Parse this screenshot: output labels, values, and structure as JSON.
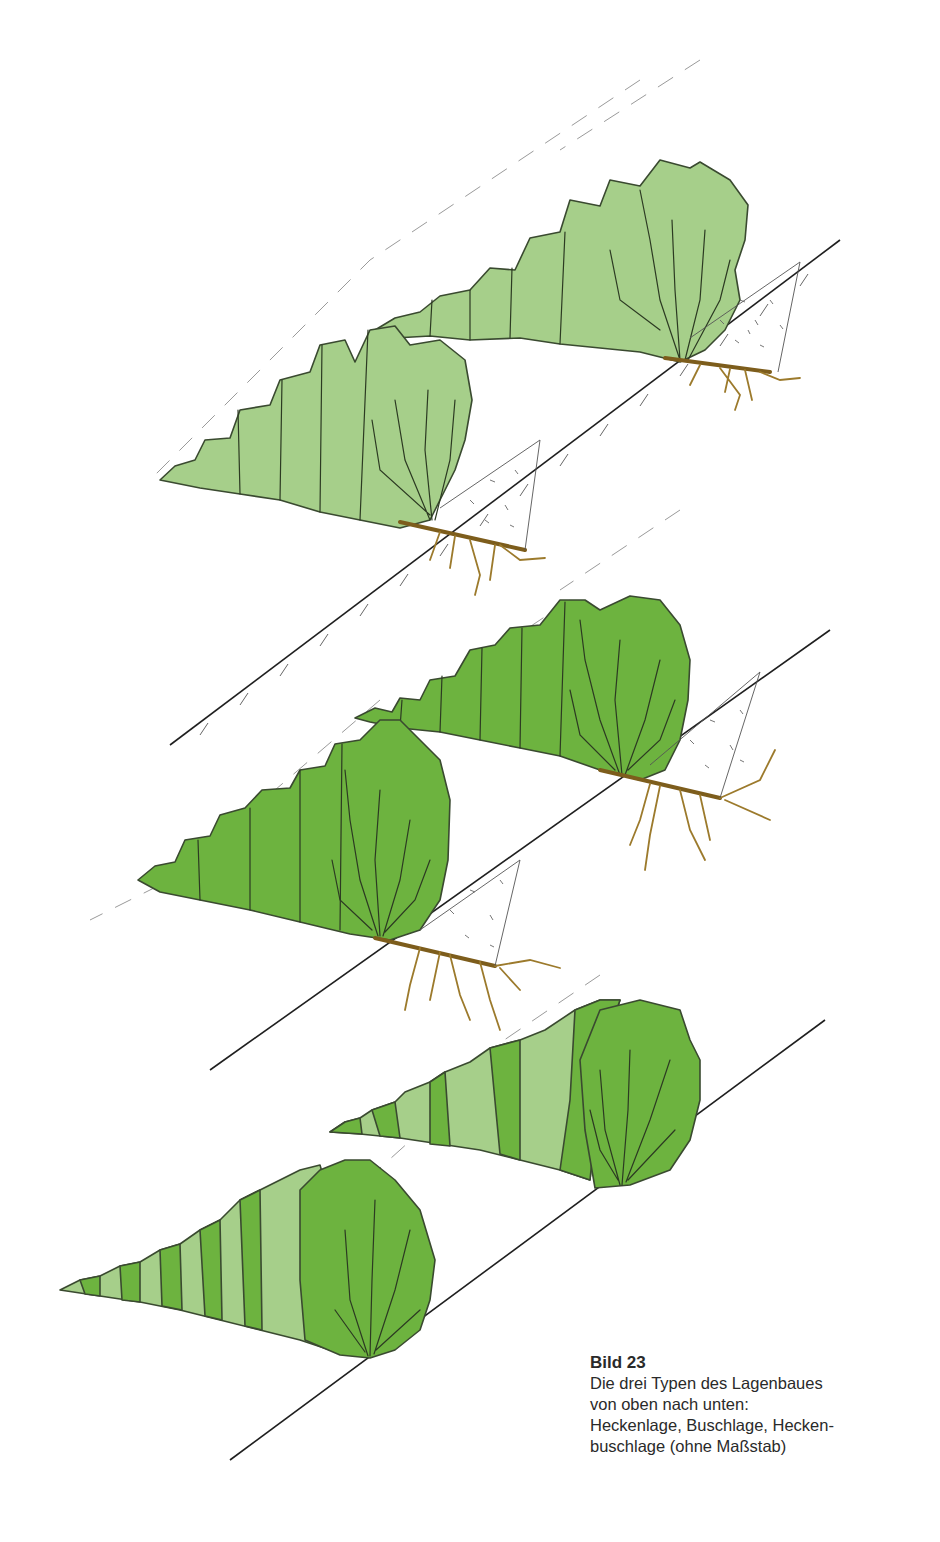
{
  "figure": {
    "label": "Bild 23",
    "caption_lines": [
      "Die drei Typen des Lagenbaues",
      "von oben nach unten:",
      "Heckenlage, Buschlage, Hecken-",
      "buschlage (ohne Maßstab)"
    ],
    "illustrations": [
      {
        "name": "Heckenlage",
        "position": "top",
        "fill_color": "#a6cf8a"
      },
      {
        "name": "Buschlage",
        "position": "middle",
        "fill_color": "#6db33f"
      },
      {
        "name": "Heckenbuschlage",
        "position": "bottom",
        "fill_colors": [
          "#6db33f",
          "#a6cf8a"
        ]
      }
    ],
    "colors": {
      "light_green": "#a6cf8a",
      "dark_green": "#6db33f",
      "outline": "#3a4a30",
      "roots": "#9c7a2c",
      "slope_line": "#1f1f1f"
    }
  }
}
